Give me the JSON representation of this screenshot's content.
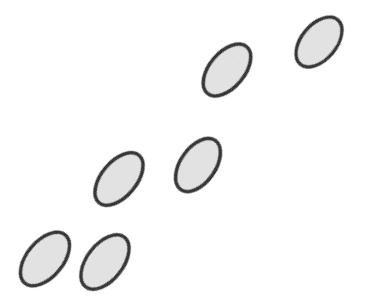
{
  "figure": {
    "title": "Diagonal arrangement of six tilted ellipses",
    "canvas": {
      "width": 366,
      "height": 308,
      "background_color": "#ffffff"
    },
    "style": {
      "fill_color": "#e4e4e4",
      "stroke_color": "#1a1a1a",
      "stroke_width": 3.5,
      "fill_texture": "fine-grain-noise"
    },
    "shape_type": "ellipse",
    "shape_count": 6,
    "arrangement": "ascending diagonal from lower-left to upper-right",
    "shapes": [
      {
        "id": "ellipse-1",
        "label": "bottom-left ellipse",
        "cx": 45,
        "cy": 259,
        "rx": 31.5,
        "ry": 18.0,
        "rotation_deg": -50
      },
      {
        "id": "ellipse-2",
        "label": "bottom-second ellipse",
        "cx": 105,
        "cy": 262,
        "rx": 31.5,
        "ry": 18.0,
        "rotation_deg": -52
      },
      {
        "id": "ellipse-3",
        "label": "middle-left ellipse",
        "cx": 119,
        "cy": 179,
        "rx": 31.0,
        "ry": 17.5,
        "rotation_deg": -50
      },
      {
        "id": "ellipse-4",
        "label": "middle-right ellipse",
        "cx": 198,
        "cy": 165,
        "rx": 30.0,
        "ry": 17.5,
        "rotation_deg": -55
      },
      {
        "id": "ellipse-5",
        "label": "top-middle ellipse",
        "cx": 227,
        "cy": 70,
        "rx": 30.5,
        "ry": 17.5,
        "rotation_deg": -50
      },
      {
        "id": "ellipse-6",
        "label": "top-right ellipse",
        "cx": 319,
        "cy": 42,
        "rx": 29.0,
        "ry": 17.5,
        "rotation_deg": -50
      }
    ]
  }
}
